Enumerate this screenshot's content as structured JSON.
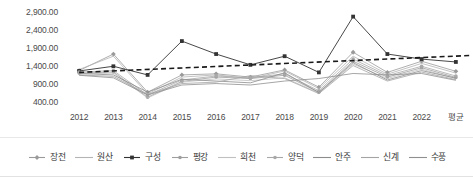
{
  "chart_data": {
    "type": "line",
    "title": "",
    "xlabel": "",
    "ylabel": "",
    "grid": false,
    "legend_position": "bottom",
    "ylim": [
      400,
      2900
    ],
    "ytick_labels": [
      "2,900.00",
      "2,400.00",
      "1,900.00",
      "1,400.00",
      "900.00",
      "400.00"
    ],
    "ytick_values": [
      2900,
      2400,
      1900,
      1400,
      900,
      400
    ],
    "categories": [
      "2012",
      "2013",
      "2014",
      "2015",
      "2016",
      "2017",
      "2018",
      "2019",
      "2020",
      "2021",
      "2022",
      "평균"
    ],
    "series": [
      {
        "name": "장전",
        "color": "#9a9a9a",
        "marker": "diamond",
        "style": "solid",
        "values": [
          1300,
          1760,
          700,
          1180,
          1210,
          1120,
          1320,
          840,
          1810,
          1250,
          1560,
          1280
        ]
      },
      {
        "name": "원산",
        "color": "#b4b4b4",
        "marker": "none",
        "style": "solid",
        "values": [
          1330,
          1700,
          650,
          1120,
          1180,
          1080,
          1290,
          800,
          1700,
          1200,
          1500,
          1230
        ]
      },
      {
        "name": "구성",
        "color": "#333333",
        "marker": "square",
        "style": "solid",
        "values": [
          1290,
          1420,
          1180,
          2120,
          1760,
          1460,
          1700,
          1250,
          2800,
          1760,
          1620,
          1540
        ]
      },
      {
        "name": "평강",
        "color": "#9e9e9e",
        "marker": "dot",
        "style": "solid",
        "values": [
          1230,
          1260,
          560,
          1000,
          1120,
          1080,
          1170,
          700,
          1560,
          1120,
          1380,
          1110
        ]
      },
      {
        "name": "희천",
        "color": "#c0c0c0",
        "marker": "none",
        "style": "solid",
        "values": [
          1210,
          1230,
          540,
          980,
          1070,
          1020,
          1100,
          680,
          1480,
          1080,
          1340,
          1080
        ]
      },
      {
        "name": "양덕",
        "color": "#a8a8a8",
        "marker": "dot",
        "style": "solid",
        "values": [
          1260,
          1300,
          620,
          1040,
          1150,
          1100,
          1210,
          740,
          1620,
          1160,
          1420,
          1150
        ]
      },
      {
        "name": "안주",
        "color": "#8c8c8c",
        "marker": "none",
        "style": "solid",
        "values": [
          1220,
          1180,
          700,
          1060,
          1010,
          960,
          1240,
          690,
          1520,
          1040,
          1300,
          1090
        ]
      },
      {
        "name": "신계",
        "color": "#a4a4a4",
        "marker": "none",
        "style": "solid",
        "values": [
          1180,
          1140,
          640,
          940,
          980,
          1160,
          1080,
          660,
          1440,
          1010,
          1260,
          1050
        ]
      },
      {
        "name": "수풍",
        "color": "#8f8f8f",
        "marker": "none",
        "style": "solid",
        "values": [
          1170,
          1100,
          620,
          900,
          940,
          900,
          1010,
          1080,
          1220,
          1180,
          1220,
          1030
        ]
      }
    ],
    "trendline": {
      "name": "trendline",
      "style": "dashed",
      "color": "#1a1a1a",
      "start": 1250,
      "end": 1720
    }
  }
}
